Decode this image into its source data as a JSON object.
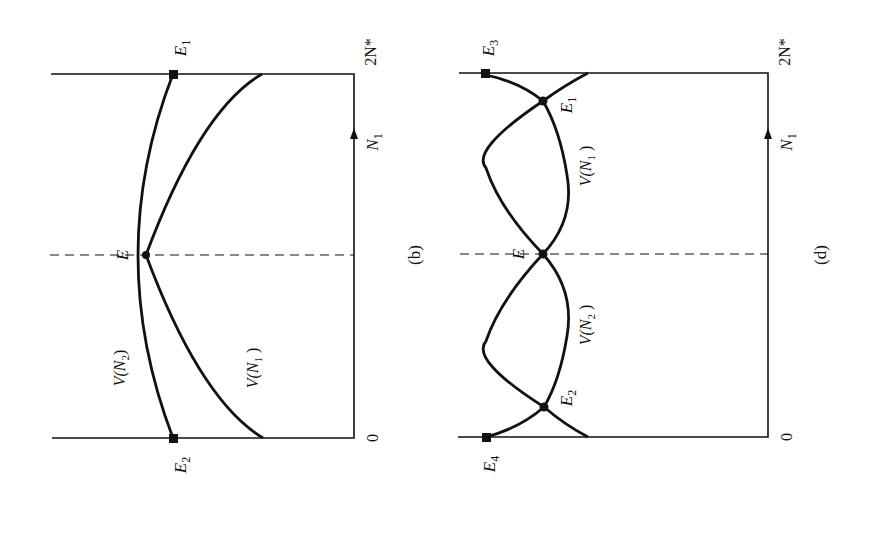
{
  "figure": {
    "orientation": "rotated 90 degrees counter-clockwise (N1 axis runs upward)",
    "panels": [
      {
        "id": "b",
        "caption": "(b)",
        "axis": {
          "label_main": "N",
          "label_sub": "1",
          "start": "0",
          "end": "2N*"
        },
        "curves": [
          {
            "name": "V(N2)",
            "label_main": "V(N",
            "label_sub": "2",
            "label_close": ")"
          },
          {
            "name": "V(N1)",
            "label_main": "V(N",
            "label_sub": "1",
            "label_close": " )"
          }
        ],
        "points": [
          {
            "name": "E",
            "label_main": "E",
            "label_sub": "",
            "marker": "circle"
          },
          {
            "name": "E1",
            "label_main": "E",
            "label_sub": "1",
            "marker": "square"
          },
          {
            "name": "E2",
            "label_main": "E",
            "label_sub": "2",
            "marker": "square"
          }
        ]
      },
      {
        "id": "d",
        "caption": "(d)",
        "axis": {
          "label_main": "N",
          "label_sub": "1",
          "start": "0",
          "end": "2N*"
        },
        "curves": [
          {
            "name": "V(N1)",
            "label_main": "V(N",
            "label_sub": "1",
            "label_close": " )"
          },
          {
            "name": "V(N2)",
            "label_main": "V(N",
            "label_sub": "2",
            "label_close": " )"
          }
        ],
        "points": [
          {
            "name": "E",
            "label_main": "E",
            "label_sub": "",
            "marker": "circle"
          },
          {
            "name": "E1",
            "label_main": "E",
            "label_sub": "1",
            "marker": "circle"
          },
          {
            "name": "E2",
            "label_main": "E",
            "label_sub": "2",
            "marker": "circle"
          },
          {
            "name": "E3",
            "label_main": "E",
            "label_sub": "3",
            "marker": "square"
          },
          {
            "name": "E4",
            "label_main": "E",
            "label_sub": "4",
            "marker": "square"
          }
        ]
      }
    ]
  },
  "style": {
    "ink": "#111111",
    "background": "#ffffff"
  }
}
